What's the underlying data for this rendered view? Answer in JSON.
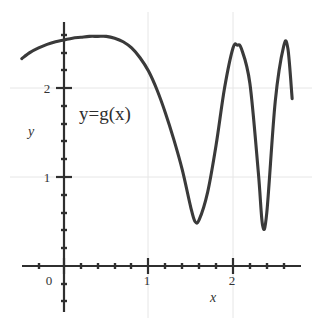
{
  "chart_data": {
    "type": "line",
    "title": "",
    "xlabel": "x",
    "ylabel": "y",
    "legend_position": "inside-upper-left",
    "annotations": [
      {
        "text": "y=g(x)",
        "x": 0.48,
        "y": 1.72
      }
    ],
    "grid": true,
    "xlim": [
      -0.5,
      2.8
    ],
    "ylim": [
      0,
      2.75
    ],
    "xticks": [
      0,
      1,
      2
    ],
    "yticks": [
      1,
      2
    ],
    "xtick_labels": [
      "0",
      "1",
      "2"
    ],
    "ytick_labels": [
      "1",
      "2"
    ],
    "xminor_step": 0.2,
    "yminor_step": 0.2,
    "series": [
      {
        "name": "y=g(x)",
        "color": "#3a3a3a",
        "x": [
          -0.5,
          -0.4,
          -0.3,
          -0.2,
          -0.1,
          0.0,
          0.1,
          0.2,
          0.3,
          0.4,
          0.5,
          0.6,
          0.7,
          0.8,
          0.9,
          1.0,
          1.1,
          1.2,
          1.3,
          1.4,
          1.5,
          1.55,
          1.6,
          1.7,
          1.8,
          1.9,
          2.0,
          2.05,
          2.1,
          2.2,
          2.3,
          2.35,
          2.4,
          2.5,
          2.6,
          2.65,
          2.7
        ],
        "y": [
          2.33,
          2.4,
          2.45,
          2.49,
          2.52,
          2.54,
          2.56,
          2.57,
          2.58,
          2.58,
          2.58,
          2.56,
          2.52,
          2.45,
          2.34,
          2.19,
          1.98,
          1.72,
          1.42,
          1.08,
          0.66,
          0.5,
          0.52,
          0.83,
          1.36,
          2.0,
          2.45,
          2.48,
          2.44,
          2.05,
          1.05,
          0.46,
          0.6,
          1.85,
          2.47,
          2.44,
          1.88
        ]
      }
    ]
  },
  "axes": {
    "x_axis_name": "x-axis",
    "y_axis_name": "y-axis"
  }
}
